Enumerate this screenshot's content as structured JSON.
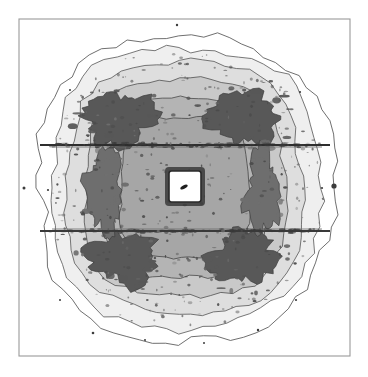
{
  "figure": {
    "background": "#ffffff",
    "width": 368,
    "height": 377,
    "frame": {
      "x": 19,
      "y": 19,
      "width": 331,
      "height": 337,
      "stroke": "#9a9a9a",
      "stroke_width": 1.1,
      "fill": "#ffffff"
    },
    "title": "",
    "xlabel": "",
    "ylabel": ""
  },
  "chart_data": {
    "type": "heatmap",
    "render": "filled-contour",
    "title": "",
    "subtitle": "",
    "xlabel": "",
    "ylabel": "",
    "legend": "none",
    "grid": false,
    "axis_ticks": [],
    "xlim": [
      19,
      350
    ],
    "ylim": [
      19,
      356
    ],
    "center": {
      "x": 185,
      "y": 188
    },
    "contour_levels": [
      {
        "index": 0,
        "label": "level-0-outer",
        "fill": "#ffffff",
        "stroke": "#4a4a4a",
        "rx": 148,
        "ry": 152,
        "squareness": 0.18,
        "noise": 5.0,
        "roughness": 74
      },
      {
        "index": 1,
        "label": "level-1",
        "fill": "#efefef",
        "stroke": "#555555",
        "rx": 134,
        "ry": 140,
        "squareness": 0.22,
        "noise": 4.2,
        "roughness": 70
      },
      {
        "index": 2,
        "label": "level-2",
        "fill": "#dedede",
        "stroke": "#555555",
        "rx": 118,
        "ry": 125,
        "squareness": 0.3,
        "noise": 3.4,
        "roughness": 66
      },
      {
        "index": 3,
        "label": "level-3",
        "fill": "#c9c9c9",
        "stroke": "#4f4f4f",
        "rx": 100,
        "ry": 108,
        "squareness": 0.44,
        "noise": 2.8,
        "roughness": 62
      },
      {
        "index": 4,
        "label": "level-4",
        "fill": "#b4b4b4",
        "stroke": "#4a4a4a",
        "rx": 82,
        "ry": 90,
        "squareness": 0.58,
        "noise": 2.4,
        "roughness": 58
      },
      {
        "index": 5,
        "label": "level-5",
        "fill": "#a6a6a6",
        "stroke": "#454545",
        "rx": 64,
        "ry": 70,
        "squareness": 0.66,
        "noise": 2.0,
        "roughness": 54
      }
    ],
    "dark_lobes": [
      {
        "name": "lobe-upper-left",
        "cx": 120,
        "cy": 118,
        "rx": 36,
        "ry": 26,
        "rot": -8,
        "fill": "#585858"
      },
      {
        "name": "lobe-upper-right",
        "cx": 243,
        "cy": 118,
        "rx": 36,
        "ry": 26,
        "rot": 8,
        "fill": "#585858"
      },
      {
        "name": "lobe-lower-left",
        "cx": 123,
        "cy": 258,
        "rx": 35,
        "ry": 25,
        "rot": 8,
        "fill": "#585858"
      },
      {
        "name": "lobe-lower-right",
        "cx": 243,
        "cy": 258,
        "rx": 35,
        "ry": 25,
        "rot": -8,
        "fill": "#585858"
      },
      {
        "name": "lobe-mid-left",
        "cx": 105,
        "cy": 190,
        "rx": 16,
        "ry": 44,
        "rot": 0,
        "fill": "#6e6e6e"
      },
      {
        "name": "lobe-mid-right",
        "cx": 262,
        "cy": 190,
        "rx": 16,
        "ry": 44,
        "rot": 0,
        "fill": "#6e6e6e"
      }
    ],
    "streaks": [
      {
        "name": "streak-upper",
        "y": 145,
        "x1": 40,
        "x2": 330,
        "color": "#2e2e2e",
        "thickness": 2.2
      },
      {
        "name": "streak-lower",
        "y": 231,
        "x1": 40,
        "x2": 330,
        "color": "#3a3a3a",
        "thickness": 1.8
      },
      {
        "name": "band-upper-edge",
        "y": 147,
        "x1": 52,
        "x2": 322,
        "color": "#6a6a6a",
        "thickness": 0.8
      },
      {
        "name": "band-lower-edge",
        "y": 229,
        "x1": 52,
        "x2": 322,
        "color": "#6a6a6a",
        "thickness": 0.8
      }
    ],
    "center_hole": {
      "name": "central-saturated-box",
      "x": 169,
      "y": 171,
      "width": 32,
      "height": 31,
      "fill": "#ffffff",
      "stroke": "#2b2b2b",
      "stroke_width": 1.6,
      "mark": {
        "cx": 184,
        "cy": 187,
        "rx": 4.0,
        "ry": 1.8,
        "rot": -28,
        "fill": "#1e1e1e"
      }
    },
    "speckles": [
      {
        "cx": 177,
        "cy": 25,
        "r": 1.2
      },
      {
        "cx": 334,
        "cy": 186,
        "r": 2.6
      },
      {
        "cx": 24,
        "cy": 188,
        "r": 1.5
      },
      {
        "cx": 48,
        "cy": 190,
        "r": 1.1
      },
      {
        "cx": 322,
        "cy": 188,
        "r": 1.1
      },
      {
        "cx": 93,
        "cy": 333,
        "r": 1.3
      },
      {
        "cx": 258,
        "cy": 330,
        "r": 1.2
      },
      {
        "cx": 204,
        "cy": 343,
        "r": 1.0
      },
      {
        "cx": 145,
        "cy": 340,
        "r": 1.0
      },
      {
        "cx": 296,
        "cy": 300,
        "r": 1.1
      },
      {
        "cx": 60,
        "cy": 300,
        "r": 1.0
      },
      {
        "cx": 300,
        "cy": 92,
        "r": 1.1
      },
      {
        "cx": 70,
        "cy": 90,
        "r": 1.0
      }
    ],
    "noise": {
      "speckle_count": 420,
      "speckle_max_radius": 1.9,
      "seed": 20240131
    }
  }
}
